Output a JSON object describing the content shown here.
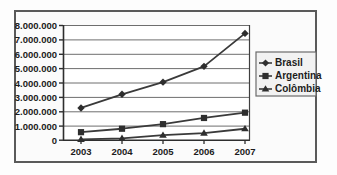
{
  "chart_data": {
    "type": "line",
    "title": "",
    "xlabel": "",
    "ylabel": "",
    "categories": [
      "2003",
      "2004",
      "2005",
      "2006",
      "2007"
    ],
    "x": [
      2003,
      2004,
      2005,
      2006,
      2007
    ],
    "ylim": [
      0,
      8000000
    ],
    "ytick_values": [
      0,
      1000000,
      2000000,
      3000000,
      4000000,
      5000000,
      6000000,
      7000000,
      8000000
    ],
    "ytick_labels": [
      "0",
      "1.000.000",
      "2.000.000",
      "3.000.000",
      "4.000.000",
      "5.000.000",
      "6.000.000",
      "7.000.000",
      "8.000.000"
    ],
    "grid": true,
    "grid_axis": "y",
    "legend_position": "right",
    "series": [
      {
        "name": "Brasil",
        "marker": "diamond",
        "color": "#3a3a3a",
        "values": [
          2250000,
          3200000,
          4050000,
          5150000,
          7450000
        ]
      },
      {
        "name": "Argentina",
        "marker": "square",
        "color": "#3a3a3a",
        "values": [
          560000,
          800000,
          1120000,
          1550000,
          1920000
        ]
      },
      {
        "name": "Colômbia",
        "marker": "triangle",
        "color": "#3a3a3a",
        "values": [
          60000,
          130000,
          350000,
          500000,
          800000
        ]
      }
    ]
  },
  "legend": {
    "items": [
      {
        "label": "Brasil",
        "marker": "diamond-marker-icon"
      },
      {
        "label": "Argentina",
        "marker": "square-marker-icon"
      },
      {
        "label": "Colômbia",
        "marker": "triangle-marker-icon"
      }
    ]
  },
  "axes": {
    "y_labels": [
      "8.000.000",
      "7.000.000",
      "6.000.000",
      "5.000.000",
      "4.000.000",
      "3.000.000",
      "2.000.000",
      "1.000.000",
      "0"
    ],
    "x_labels": [
      "2003",
      "2004",
      "2005",
      "2006",
      "2007"
    ]
  },
  "colors": {
    "frame": "#5a5a5a",
    "plot_border": "#3f3f3f",
    "gridline": "#6e6e6e",
    "series_line": "#3a3a3a",
    "text": "#1c1c1c",
    "legend_bg": "#f2f2f2",
    "page_bg": "#fdfdfd"
  }
}
